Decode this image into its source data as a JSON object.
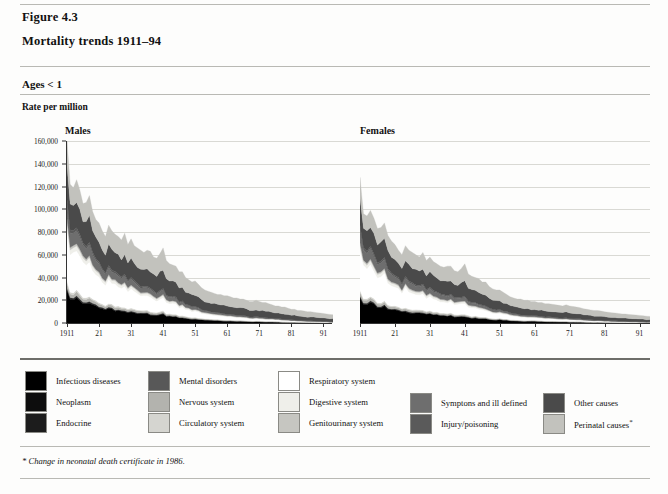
{
  "figure": {
    "label": "Figure 4.3",
    "title": "Mortality trends 1911–94",
    "ages": "Ages < 1",
    "rate_label": "Rate per million",
    "footnote": "* Change in neonatal death certificate in 1986."
  },
  "legend": {
    "columns": [
      {
        "items": [
          {
            "label": "Infectious diseases",
            "color": "#000000"
          },
          {
            "label": "Neoplasm",
            "color": "#0d0d0d"
          },
          {
            "label": "Endocrine",
            "color": "#1c1c1c"
          }
        ]
      },
      {
        "items": [
          {
            "label": "Mental disorders",
            "color": "#585858"
          },
          {
            "label": "Nervous system",
            "color": "#b3b3ae"
          },
          {
            "label": "Circulatory system",
            "color": "#d5d5d0"
          }
        ]
      },
      {
        "items": [
          {
            "label": "Respiratory system",
            "color": "#ffffff"
          },
          {
            "label": "Digestive system",
            "color": "#efefea"
          },
          {
            "label": "Genitourinary system",
            "color": "#c6c6c1"
          }
        ]
      },
      {
        "items": [
          {
            "label": "Symptons and ill defined",
            "color": "#6e6e6e"
          },
          {
            "label": "Injury/poisoning",
            "color": "#5a5a5a"
          }
        ]
      },
      {
        "items": [
          {
            "label": "Other causes",
            "color": "#4a4a4a"
          },
          {
            "label": "Perinatal causes",
            "color": "#c2c2bd",
            "asterisk": "*"
          }
        ]
      }
    ]
  },
  "chart_data": {
    "type": "area",
    "title": "Mortality trends 1911–94",
    "subtitle": "Ages < 1",
    "ylabel": "Rate per million",
    "xlabel": "",
    "ylim": [
      0,
      160000
    ],
    "ytick_labels": [
      "0",
      "20,000",
      "40,000",
      "60,000",
      "80,000",
      "100,000",
      "120,000",
      "140,000",
      "160,000"
    ],
    "ytick_values": [
      0,
      20000,
      40000,
      60000,
      80000,
      100000,
      120000,
      140000,
      160000
    ],
    "xlim": [
      1911,
      1994
    ],
    "xtick_values": [
      1911,
      1921,
      1931,
      1941,
      1951,
      1961,
      1971,
      1981,
      1991
    ],
    "xtick_labels": [
      "1911",
      "21",
      "31",
      "41",
      "51",
      "61",
      "71",
      "81",
      "91"
    ],
    "grid": true,
    "legend_position": "bottom",
    "stacked": true,
    "panels": [
      {
        "name": "Males",
        "x": [
          1911,
          1912,
          1913,
          1914,
          1915,
          1916,
          1917,
          1918,
          1919,
          1920,
          1921,
          1922,
          1923,
          1924,
          1925,
          1926,
          1927,
          1928,
          1929,
          1930,
          1931,
          1932,
          1933,
          1934,
          1935,
          1936,
          1937,
          1938,
          1939,
          1940,
          1941,
          1942,
          1943,
          1944,
          1945,
          1946,
          1947,
          1948,
          1949,
          1950,
          1951,
          1952,
          1953,
          1954,
          1955,
          1956,
          1957,
          1958,
          1959,
          1960,
          1961,
          1962,
          1963,
          1964,
          1965,
          1966,
          1967,
          1968,
          1969,
          1970,
          1971,
          1972,
          1973,
          1974,
          1975,
          1976,
          1977,
          1978,
          1979,
          1980,
          1981,
          1982,
          1983,
          1984,
          1985,
          1986,
          1987,
          1988,
          1989,
          1990,
          1991,
          1992,
          1993,
          1994
        ],
        "totals": [
          160000,
          122000,
          119000,
          126000,
          117000,
          105000,
          106000,
          112000,
          98000,
          91000,
          88000,
          81000,
          76000,
          86000,
          81000,
          78000,
          76000,
          73000,
          79000,
          69000,
          74000,
          68000,
          66000,
          64000,
          62000,
          64000,
          63000,
          58000,
          57000,
          61000,
          66000,
          55000,
          52000,
          51000,
          50000,
          45000,
          45000,
          40000,
          38000,
          36000,
          37000,
          34000,
          31000,
          29000,
          28000,
          27000,
          26000,
          25000,
          25000,
          24000,
          24000,
          23000,
          22000,
          22000,
          21000,
          21000,
          20000,
          19000,
          19000,
          20000,
          19000,
          18000,
          18000,
          17000,
          16000,
          15000,
          15000,
          14000,
          14000,
          13000,
          12000,
          12000,
          11000,
          11000,
          10500,
          10000,
          10000,
          9500,
          9000,
          8700,
          8400,
          8000,
          7500,
          7200
        ]
      },
      {
        "name": "Females",
        "x": [
          1911,
          1912,
          1913,
          1914,
          1915,
          1916,
          1917,
          1918,
          1919,
          1920,
          1921,
          1922,
          1923,
          1924,
          1925,
          1926,
          1927,
          1928,
          1929,
          1930,
          1931,
          1932,
          1933,
          1934,
          1935,
          1936,
          1937,
          1938,
          1939,
          1940,
          1941,
          1942,
          1943,
          1944,
          1945,
          1946,
          1947,
          1948,
          1949,
          1950,
          1951,
          1952,
          1953,
          1954,
          1955,
          1956,
          1957,
          1958,
          1959,
          1960,
          1961,
          1962,
          1963,
          1964,
          1965,
          1966,
          1967,
          1968,
          1969,
          1970,
          1971,
          1972,
          1973,
          1974,
          1975,
          1976,
          1977,
          1978,
          1979,
          1980,
          1981,
          1982,
          1983,
          1984,
          1985,
          1986,
          1987,
          1988,
          1989,
          1990,
          1991,
          1992,
          1993,
          1994
        ],
        "totals": [
          128000,
          96000,
          94000,
          99000,
          92000,
          83000,
          84000,
          88000,
          77000,
          72000,
          69000,
          64000,
          60000,
          68000,
          64000,
          62000,
          60000,
          58000,
          62000,
          55000,
          58000,
          54000,
          52000,
          50000,
          49000,
          50000,
          50000,
          46000,
          45000,
          48000,
          52000,
          43000,
          41000,
          40000,
          39000,
          36000,
          36000,
          32000,
          30000,
          29000,
          29000,
          27000,
          25000,
          23000,
          22000,
          21000,
          21000,
          20000,
          20000,
          19000,
          19000,
          18000,
          18000,
          17000,
          17000,
          16500,
          16000,
          15500,
          15000,
          16000,
          15000,
          14500,
          14000,
          13500,
          12500,
          12000,
          11500,
          11000,
          11000,
          10500,
          9800,
          9500,
          9000,
          8800,
          8400,
          8000,
          7900,
          7500,
          7200,
          7000,
          6700,
          6400,
          6000,
          5800
        ]
      }
    ],
    "series": [
      {
        "name": "Infectious diseases",
        "color": "#000000",
        "share": 0.085
      },
      {
        "name": "Neoplasm",
        "color": "#0d0d0d",
        "share": 0.004
      },
      {
        "name": "Endocrine",
        "color": "#1c1c1c",
        "share": 0.006
      },
      {
        "name": "Mental disorders",
        "color": "#585858",
        "share": 0.003
      },
      {
        "name": "Nervous system",
        "color": "#b3b3ae",
        "share": 0.022
      },
      {
        "name": "Circulatory system",
        "color": "#d5d5d0",
        "share": 0.012
      },
      {
        "name": "Respiratory system",
        "color": "#ffffff",
        "share": 0.145
      },
      {
        "name": "Digestive system",
        "color": "#efefea",
        "share": 0.03
      },
      {
        "name": "Genitourinary system",
        "color": "#c6c6c1",
        "share": 0.014
      },
      {
        "name": "Symptons and ill defined",
        "color": "#6e6e6e",
        "share": 0.052
      },
      {
        "name": "Injury/poisoning",
        "color": "#5a5a5a",
        "share": 0.018
      },
      {
        "name": "Other causes",
        "color": "#4a4a4a",
        "share": 0.29
      },
      {
        "name": "Perinatal causes",
        "color": "#c2c2bd",
        "share": 0.319
      }
    ]
  }
}
